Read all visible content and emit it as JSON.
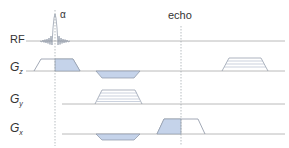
{
  "diagram": {
    "type": "pulse-sequence",
    "labels": {
      "rf": "RF",
      "gz_main": "G",
      "gz_sub": "z",
      "gy_main": "G",
      "gy_sub": "y",
      "gx_main": "G",
      "gx_sub": "x",
      "alpha": "α",
      "echo": "echo"
    },
    "colors": {
      "line": "#9a9a9a",
      "fill": "#c5d3ea",
      "stroke": "#8a93a3",
      "marker": "#9aa0a8",
      "text": "#333333"
    },
    "rows": [
      {
        "name": "RF",
        "baseline_y": 41
      },
      {
        "name": "Gz",
        "baseline_y": 71
      },
      {
        "name": "Gy",
        "baseline_y": 104
      },
      {
        "name": "Gx",
        "baseline_y": 134
      }
    ],
    "markers": [
      {
        "name": "alpha",
        "x": 55
      },
      {
        "name": "echo",
        "x": 181
      }
    ]
  }
}
